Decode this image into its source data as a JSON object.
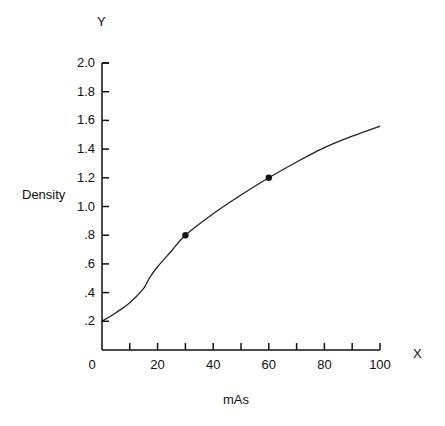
{
  "chart_data": {
    "type": "line",
    "title": "",
    "xlabel": "mAs",
    "ylabel": "Density",
    "x_axis_letter": "X",
    "y_axis_letter": "Y",
    "xlim": [
      0,
      100
    ],
    "ylim": [
      0,
      2.0
    ],
    "x_ticks": [
      "0",
      "20",
      "40",
      "60",
      "80",
      "100"
    ],
    "y_ticks": [
      ".2",
      ".4",
      ".6",
      ".8",
      "1.0",
      "1.2",
      "1.4",
      "1.6",
      "1.8",
      "2.0"
    ],
    "grid": false,
    "legend": "none",
    "series": [
      {
        "name": "Density curve",
        "x": [
          0,
          5,
          10,
          15,
          17,
          20,
          25,
          30,
          40,
          50,
          60,
          70,
          80,
          90,
          100
        ],
        "values": [
          0.2,
          0.26,
          0.33,
          0.43,
          0.5,
          0.58,
          0.69,
          0.8,
          0.95,
          1.08,
          1.2,
          1.31,
          1.41,
          1.49,
          1.56
        ]
      }
    ],
    "marked_points": [
      {
        "x": 30,
        "y": 0.8
      },
      {
        "x": 60,
        "y": 1.2
      }
    ]
  }
}
